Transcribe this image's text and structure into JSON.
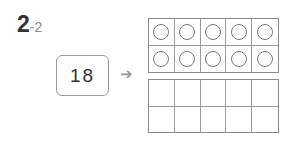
{
  "problem": {
    "main": "2",
    "sub": "-2"
  },
  "number_box": {
    "value": "18"
  },
  "arrow": {
    "glyph": "➔"
  },
  "ten_frames": [
    {
      "filled_circles": 10,
      "rows": 2,
      "cols": 5
    },
    {
      "filled_circles": 0,
      "rows": 2,
      "cols": 5
    }
  ]
}
